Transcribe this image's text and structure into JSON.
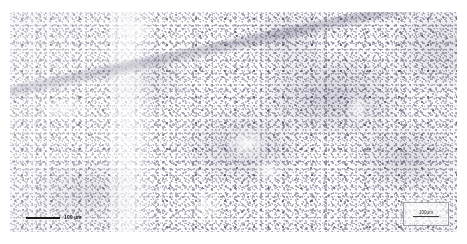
{
  "figure": {
    "type": "photomicrograph",
    "stain_tone": "#6c6880",
    "background_color": "#ffffff",
    "field_color": "#fdfdfe"
  },
  "scalebar": {
    "label": "100 µm",
    "bar_color": "#1b1b1b"
  },
  "corner_annotation": {
    "label": "100µm"
  }
}
